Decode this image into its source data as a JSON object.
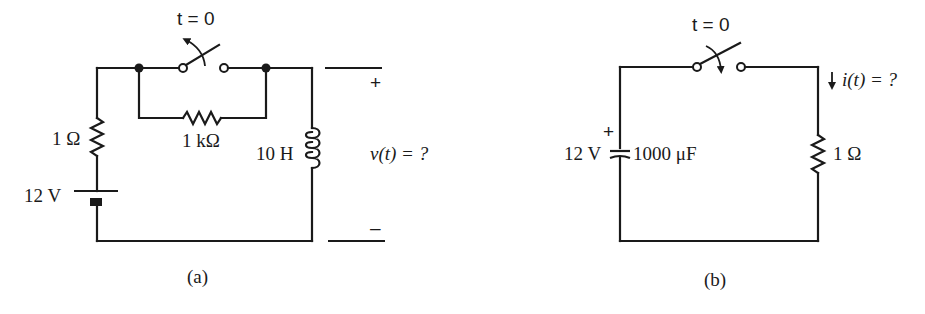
{
  "figure": {
    "circuit_a": {
      "caption": "(a)",
      "switch_label": "t = 0",
      "switch_action": "opens",
      "resistor_series_label": "1 Ω",
      "resistor_parallel_label": "1 kΩ",
      "inductor_label": "10 H",
      "battery_label": "12 V",
      "output_plus": "+",
      "output_minus": "–",
      "output_question": "v(t) = ?"
    },
    "circuit_b": {
      "caption": "(b)",
      "switch_label": "t = 0",
      "switch_action": "closes",
      "capacitor_voltage_label": "12 V",
      "capacitor_polarity": "+",
      "capacitor_label": "1000 μF",
      "resistor_label": "1 Ω",
      "current_question": "i(t) = ?"
    }
  },
  "colors": {
    "ink": "#1a1a1a",
    "background": "#ffffff"
  }
}
